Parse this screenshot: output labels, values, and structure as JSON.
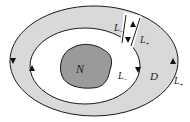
{
  "diagram": {
    "type": "annular-domain-with-cut",
    "colors": {
      "annulus_fill": "#d9d9d9",
      "obstacle_fill": "#9a9a9a",
      "stroke": "#1a1a1a",
      "background": "#ffffff"
    },
    "labels": {
      "obstacle": "N",
      "domain": "D",
      "cut_left": {
        "base": "L",
        "sub": "−"
      },
      "cut_right": {
        "base": "L",
        "sub": "+"
      },
      "inner_boundary": {
        "base": "L",
        "sub": "−"
      },
      "outer_boundary": {
        "base": "L",
        "sub": "+"
      }
    },
    "arrows": [
      {
        "name": "outer-left",
        "direction": "down"
      },
      {
        "name": "inner-left",
        "direction": "up"
      },
      {
        "name": "inner-right",
        "direction": "down"
      },
      {
        "name": "outer-right",
        "direction": "up"
      },
      {
        "name": "cut-left",
        "direction": "up"
      },
      {
        "name": "cut-right",
        "direction": "down"
      }
    ]
  }
}
